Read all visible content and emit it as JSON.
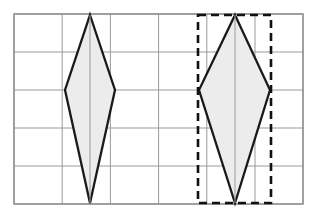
{
  "figure": {
    "caption": "",
    "background_color": "#ffffff"
  },
  "grid": {
    "label": "coordinate-grid",
    "columns": 6,
    "rows": 5,
    "cell_width": 48.2,
    "cell_height": 38,
    "origin_x": 14,
    "origin_y": 14,
    "width": 289,
    "height": 190,
    "line_color": "#9a9a9a",
    "border_color": "#8d8d8d",
    "line_width": 1,
    "border_width": 1.4,
    "x_lines": [
      14,
      62.2,
      110.4,
      158.6,
      206.8,
      255,
      303
    ],
    "y_lines": [
      14,
      52,
      90,
      128,
      166,
      204
    ]
  },
  "shapes": [
    {
      "id": "left-kite",
      "name": "kite-polygon-left",
      "type": "kite",
      "fill": "#ececec",
      "stroke": "#1a1a1a",
      "stroke_width": 2.3,
      "vertices": [
        {
          "label": "top",
          "x": 90,
          "y": 15
        },
        {
          "label": "right",
          "x": 115,
          "y": 90
        },
        {
          "label": "bottom",
          "x": 90,
          "y": 203
        },
        {
          "label": "left",
          "x": 65,
          "y": 90
        }
      ],
      "points_attr": "90,15 115,90 90,203 65,90",
      "diagonals": {
        "vertical_length": 188,
        "horizontal_length": 50
      },
      "has_bounding_box": false
    },
    {
      "id": "right-kite",
      "name": "kite-polygon-right",
      "type": "kite",
      "fill": "#ececec",
      "stroke": "#1a1a1a",
      "stroke_width": 2.3,
      "vertices": [
        {
          "label": "top",
          "x": 235,
          "y": 15
        },
        {
          "label": "right",
          "x": 270,
          "y": 90
        },
        {
          "label": "bottom",
          "x": 235,
          "y": 203
        },
        {
          "label": "left",
          "x": 199,
          "y": 90
        }
      ],
      "points_attr": "235,15 270,90 235,203 199,90",
      "diagonals": {
        "vertical_length": 188,
        "horizontal_length": 71
      },
      "has_bounding_box": true
    }
  ],
  "bounding_box": {
    "name": "dashed-bounding-rectangle",
    "stroke": "#111111",
    "stroke_width": 2.6,
    "dash_pattern": "8,5",
    "fill": "none",
    "x": 198,
    "y": 15,
    "width": 73,
    "height": 188
  },
  "interior_lines": [
    {
      "name": "left-kite-axis",
      "x1": 90,
      "y1": 15,
      "x2": 90,
      "y2": 203,
      "stroke": "#9a9a9a",
      "stroke_width": 1
    },
    {
      "name": "right-kite-axis",
      "x1": 235,
      "y1": 15,
      "x2": 235,
      "y2": 203,
      "stroke": "#9a9a9a",
      "stroke_width": 1
    }
  ],
  "colors": {
    "shape_fill": "#ececec",
    "shape_outline": "#1a1a1a",
    "grid_line": "#9a9a9a",
    "dashed_outline": "#111111",
    "page_background": "#ffffff"
  }
}
